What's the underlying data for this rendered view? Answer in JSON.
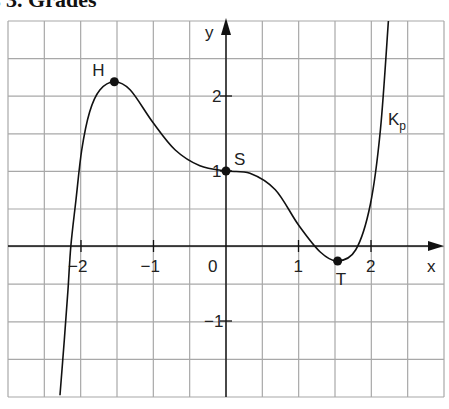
{
  "title": "s 3. Grades",
  "chart_data": {
    "type": "line",
    "title": "s 3. Grades",
    "xlabel": "x",
    "ylabel": "y",
    "xlim": [
      -3.1,
      3.0
    ],
    "ylim": [
      -2.0,
      3.0
    ],
    "grid": true,
    "grid_step": 0.5,
    "x_ticks": [
      {
        "v": -2,
        "label": "−2"
      },
      {
        "v": -1,
        "label": "−1"
      },
      {
        "v": 0,
        "label": "0"
      },
      {
        "v": 1,
        "label": "1"
      },
      {
        "v": 2,
        "label": "2"
      }
    ],
    "y_ticks": [
      {
        "v": 2,
        "label": "2"
      },
      {
        "v": 1,
        "label": "1"
      },
      {
        "v": -1,
        "label": "−1"
      }
    ],
    "series": [
      {
        "name": "Kp",
        "label": "K",
        "label_sub": "p",
        "points": [
          [
            -2.29,
            -1.99
          ],
          [
            -2.23,
            -1.25
          ],
          [
            -2.18,
            -0.59
          ],
          [
            -2.14,
            0.0
          ],
          [
            -2.07,
            0.61
          ],
          [
            -1.99,
            1.28
          ],
          [
            -1.88,
            1.79
          ],
          [
            -1.74,
            2.08
          ],
          [
            -1.54,
            2.19
          ],
          [
            -1.32,
            2.08
          ],
          [
            -1.01,
            1.65
          ],
          [
            -0.7,
            1.28
          ],
          [
            -0.36,
            1.07
          ],
          [
            0.0,
            1.0
          ],
          [
            0.33,
            0.97
          ],
          [
            0.68,
            0.75
          ],
          [
            1.0,
            0.28
          ],
          [
            1.3,
            -0.08
          ],
          [
            1.54,
            -0.2
          ],
          [
            1.79,
            -0.05
          ],
          [
            1.99,
            0.55
          ],
          [
            2.13,
            1.55
          ],
          [
            2.24,
            3.0
          ]
        ]
      }
    ],
    "annotations": [
      {
        "label": "H",
        "x": -1.54,
        "y": 2.19
      },
      {
        "label": "S",
        "x": 0.0,
        "y": 1.0
      },
      {
        "label": "T",
        "x": 1.54,
        "y": -0.2
      }
    ]
  }
}
